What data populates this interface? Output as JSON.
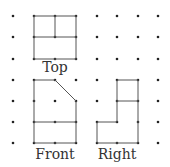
{
  "diagram": {
    "type": "orthographic-views-on-dot-grid",
    "grid": {
      "columns_x": [
        13,
        34,
        55,
        76,
        97,
        117,
        138,
        158
      ],
      "rows_y": [
        16,
        37,
        59,
        80,
        101,
        122,
        143
      ],
      "dot_color": "#222222"
    },
    "views": [
      {
        "name": "Top",
        "label": "Top",
        "label_pos": [
          55,
          68
        ]
      },
      {
        "name": "Front",
        "label": "Front",
        "label_pos": [
          55,
          150
        ]
      },
      {
        "name": "Right",
        "label": "Right",
        "label_pos": [
          117,
          150
        ]
      }
    ],
    "line_color": "#555555"
  }
}
